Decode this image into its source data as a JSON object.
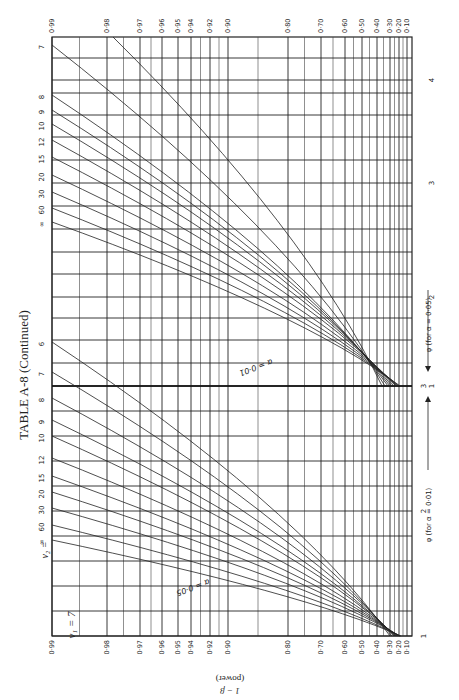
{
  "title": "TABLE A-8 (Continued)",
  "nu1_label": "ν₁ = 7",
  "nu2_label": "ν₂ =",
  "y_axis_label_line1": "1 − β",
  "y_axis_label_line2": "(power)",
  "phi_label_001": "φ (for α = 0·01)",
  "phi_label_005": "φ (for α = 0·05)",
  "alpha_label_005": "α = 0·05",
  "alpha_label_001": "α = 0·01",
  "chart_data": {
    "type": "line",
    "orientation": "rotated",
    "power_axis": {
      "label": "1 − β (power)",
      "ticks": [
        "0·99",
        "0·98",
        "0·97",
        "0·96",
        "0·95",
        "0·94",
        "0·92",
        "0·90",
        "0·80",
        "0·70",
        "0·60",
        "0·50",
        "0·40",
        "0·30",
        "0·20",
        "0·10"
      ],
      "values": [
        0.99,
        0.98,
        0.97,
        0.96,
        0.95,
        0.94,
        0.92,
        0.9,
        0.8,
        0.7,
        0.6,
        0.5,
        0.4,
        0.3,
        0.2,
        0.1
      ]
    },
    "phi_axis_alpha_001": {
      "label": "φ (for α = 0·01)",
      "ticks": [
        "1",
        "2",
        "3"
      ],
      "range": [
        1,
        3
      ]
    },
    "phi_axis_alpha_005": {
      "label": "φ (for α = 0·05)",
      "ticks": [
        "1",
        "2",
        "3",
        "4"
      ],
      "range": [
        1,
        4
      ]
    },
    "nu1": 7,
    "nu2_values": [
      "6",
      "7",
      "8",
      "9",
      "10",
      "12",
      "15",
      "20",
      "30",
      "60",
      "∞"
    ],
    "panels": [
      {
        "alpha": 0.05,
        "curve_labels_left": [
          "6",
          "7",
          "8",
          "9",
          "10",
          "12",
          "15",
          "20",
          "30",
          "60",
          "∞"
        ],
        "curve_labels_mid": [
          "6",
          "7",
          "8",
          "9",
          "10",
          "12",
          "15",
          "20",
          "30",
          "60",
          "∞"
        ]
      },
      {
        "alpha": 0.01,
        "curve_labels_left": [
          "7",
          "8",
          "9",
          "10",
          "12",
          "15",
          "20",
          "30",
          "60",
          "∞"
        ],
        "curve_labels_mid": [
          "6",
          "7",
          "8",
          "9",
          "10",
          "12",
          "15",
          "20",
          "30",
          "60",
          "∞"
        ]
      }
    ],
    "grid": true,
    "legend": "curve labels inline (ν₂ values)"
  }
}
